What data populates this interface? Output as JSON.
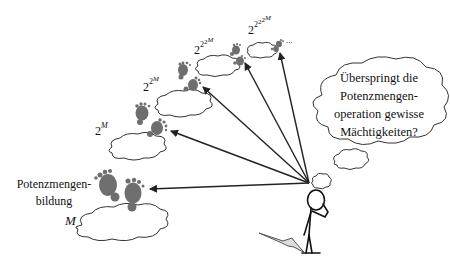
{
  "diagram": {
    "base_set_label": "M",
    "operation_label": "Potenzmengen-\nbildung",
    "operation_label_lines": [
      "Potenzmengen-",
      "bildung"
    ],
    "levels": [
      {
        "base": "2",
        "exponent": "M",
        "text": "2^M"
      },
      {
        "base": "2",
        "exponent": "2^M",
        "text": "2^{2^M}"
      },
      {
        "base": "2",
        "exponent": "2^{2^M}",
        "text": "2^{2^{2^M}}"
      },
      {
        "base": "2",
        "exponent": "2^{2^{2^M}}",
        "text": "2^{2^{2^{2^M}}}"
      }
    ],
    "ellipsis": "...",
    "thought_bubble": {
      "lines": [
        "Überspringt die",
        "Potenzmengen-",
        "operation gewisse",
        "Mächtigkeiten?"
      ]
    },
    "colors": {
      "stroke": "#222222",
      "footprint": "#6e6e6e",
      "background": "#ffffff"
    }
  }
}
